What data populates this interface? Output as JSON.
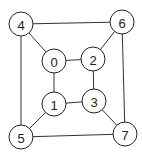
{
  "graph": {
    "nodes": [
      {
        "id": "0",
        "label": "0",
        "x": 54,
        "y": 61
      },
      {
        "id": "1",
        "label": "1",
        "x": 54,
        "y": 104
      },
      {
        "id": "2",
        "label": "2",
        "x": 93,
        "y": 59
      },
      {
        "id": "3",
        "label": "3",
        "x": 94,
        "y": 101
      },
      {
        "id": "4",
        "label": "4",
        "x": 21,
        "y": 24
      },
      {
        "id": "5",
        "label": "5",
        "x": 21,
        "y": 137
      },
      {
        "id": "6",
        "label": "6",
        "x": 122,
        "y": 22
      },
      {
        "id": "7",
        "label": "7",
        "x": 125,
        "y": 134
      }
    ],
    "edges": [
      [
        "4",
        "6"
      ],
      [
        "4",
        "0"
      ],
      [
        "4",
        "5"
      ],
      [
        "6",
        "2"
      ],
      [
        "6",
        "7"
      ],
      [
        "0",
        "2"
      ],
      [
        "0",
        "1"
      ],
      [
        "2",
        "3"
      ],
      [
        "1",
        "3"
      ],
      [
        "1",
        "5"
      ],
      [
        "3",
        "7"
      ],
      [
        "5",
        "7"
      ]
    ],
    "node_radius": 12
  }
}
